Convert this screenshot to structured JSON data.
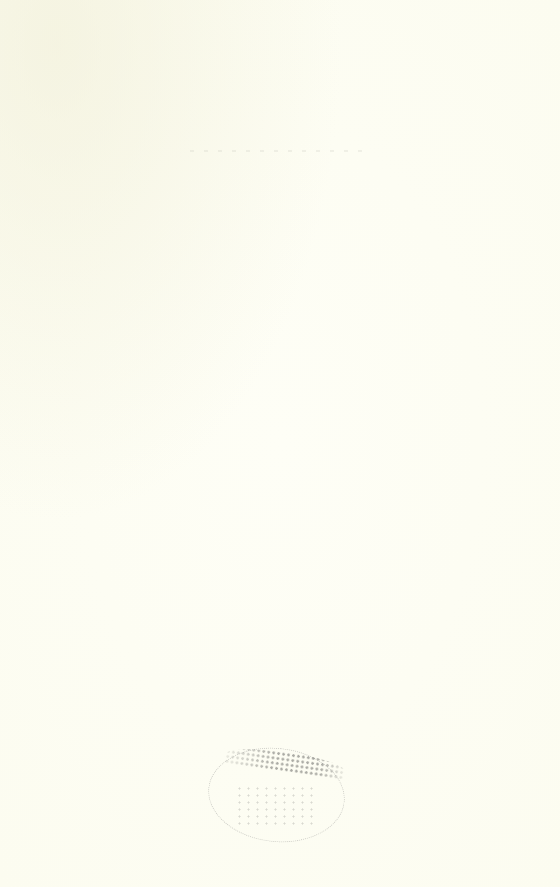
{
  "page": {
    "type": "blank-scanned-page",
    "background_color": "#fdfdf3"
  },
  "stamp": {
    "shape": "oval",
    "legible_text": ""
  }
}
